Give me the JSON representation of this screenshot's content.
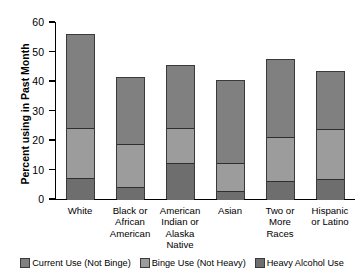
{
  "chart_data": {
    "type": "bar",
    "subtype": "stacked-bar",
    "title": "",
    "xlabel": "",
    "ylabel": "Percent using in Past Month",
    "ylim": [
      0,
      60
    ],
    "yticks": [
      0,
      10,
      20,
      30,
      40,
      50,
      60
    ],
    "ytick_labels": [
      "0",
      "10",
      "20",
      "30",
      "40",
      "50",
      "60"
    ],
    "grid": false,
    "legend_position": "bottom",
    "categories": [
      "White",
      "Black or African American",
      "American Indian or Alaska Native",
      "Asian",
      "Two or More Races",
      "Hispanic or Latino"
    ],
    "category_label_lines": [
      [
        "White"
      ],
      [
        "Black or",
        "African",
        "American"
      ],
      [
        "American",
        "Indian or",
        "Alaska",
        "Native"
      ],
      [
        "Asian"
      ],
      [
        "Two or",
        "More",
        "Races"
      ],
      [
        "Hispanic",
        "or Latino"
      ]
    ],
    "series": [
      {
        "name": "Heavy Alcohol Use",
        "color": "#6e6e6e",
        "values": [
          7.5,
          4.5,
          12.5,
          3.0,
          6.5,
          7.0
        ]
      },
      {
        "name": "Binge Use (Not Heavy)",
        "color": "#9c9c9c",
        "values": [
          17.0,
          14.5,
          12.0,
          9.5,
          15.0,
          17.0
        ]
      },
      {
        "name": "Current Use (Not Binge)",
        "color": "#808080",
        "values": [
          31.5,
          22.5,
          21.0,
          28.0,
          26.0,
          19.5
        ]
      }
    ],
    "segment_boundaries": [
      [
        7.5,
        24.5,
        56.0
      ],
      [
        4.5,
        19.0,
        41.5
      ],
      [
        12.5,
        24.5,
        45.5
      ],
      [
        3.0,
        12.5,
        40.5
      ],
      [
        6.5,
        21.5,
        47.5
      ],
      [
        7.0,
        24.0,
        43.5
      ]
    ],
    "totals": [
      56.0,
      41.5,
      45.5,
      40.5,
      47.5,
      43.5
    ]
  },
  "legend": {
    "items": [
      {
        "label": "Current Use (Not Binge)",
        "color": "#808080"
      },
      {
        "label": "Binge Use (Not Heavy)",
        "color": "#9c9c9c"
      },
      {
        "label": "Heavy Alcohol Use",
        "color": "#6e6e6e"
      }
    ]
  },
  "axis": {
    "y_title": "Percent using in Past Month"
  }
}
